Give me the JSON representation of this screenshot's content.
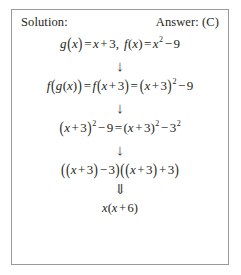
{
  "box": {
    "header": {
      "left_label": "Solution:",
      "right_label": "Answer: (C)"
    },
    "steps": [
      {
        "id": "definitions",
        "text": "g(x) = x + 3,  f(x) = x² − 9"
      },
      {
        "id": "composition",
        "text": "f(g(x)) = f(x + 3) = (x + 3)² − 9"
      },
      {
        "id": "difference-of-squares-setup",
        "text": "(x + 3)² − 9 = (x + 3)² − 3²"
      },
      {
        "id": "factored",
        "text": "((x + 3) − 3)((x + 3) + 3)"
      },
      {
        "id": "final-answer",
        "text": "x(x + 6)"
      }
    ],
    "arrows": [
      {
        "id": "arrow-1",
        "glyph": "↓"
      },
      {
        "id": "arrow-2",
        "glyph": "↓"
      },
      {
        "id": "arrow-3",
        "glyph": "↓"
      },
      {
        "id": "arrow-4",
        "glyph": "⇓"
      }
    ],
    "colors": {
      "text": "#231f20",
      "border": "#9a9a9a",
      "background": "#ffffff",
      "arrow": "#3a3a3a"
    }
  }
}
